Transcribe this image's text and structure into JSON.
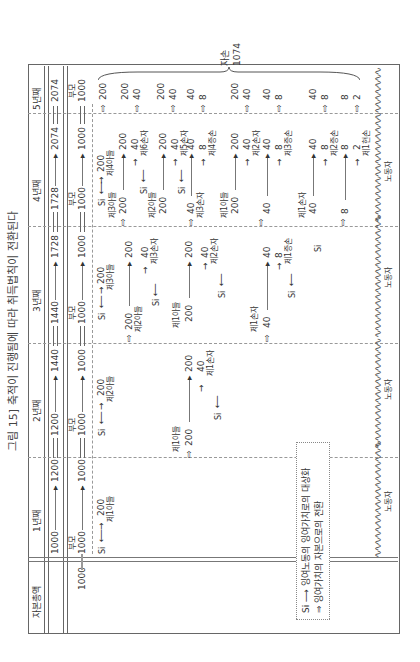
{
  "title": "그림 15] 축적이 진행됨에 따라 취득법칙이 전환된다",
  "years": [
    "1년째",
    "2년째",
    "3년째",
    "4년째",
    "5년째"
  ],
  "row_header": "자본총액",
  "total_capital": {
    "start": "1000",
    "y1_end": "1200",
    "y2_start": "1200",
    "y2_end": "1440",
    "y3_start": "1440",
    "y3_end": "1728",
    "y4_start": "1728",
    "y4_end": "2074",
    "y5": "2074"
  },
  "parents_label": "부모",
  "parents_value": "1000",
  "si": "Si",
  "labor": "노동자",
  "descendants_label": "자손",
  "descendants_total": "1074",
  "nodes": {
    "son1": "제1아들",
    "son2": "제2아들",
    "son3": "제3아들",
    "son4": "제4아들",
    "gs1": "제1손자",
    "gs2": "제2손자",
    "gs3": "제3손자",
    "gs5": "제5손자",
    "gs6": "제6손자",
    "ggs1": "제1증손",
    "ggs2": "제2증손",
    "ggs3": "제3증손",
    "ggs4": "제4증손",
    "gggs1": "제1현손"
  },
  "values": {
    "v200": "200",
    "v40": "40",
    "v8": "8",
    "v2": "2",
    "v1000": "1000"
  },
  "legend": {
    "row1_symbol": "Si ⟶",
    "row1_text": "잉여노동의 잉여가치로의 대상화",
    "row2_symbol": "⇒",
    "row2_text": "잉여가치의 자본으로의 전환"
  }
}
